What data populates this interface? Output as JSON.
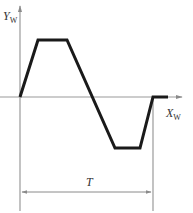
{
  "diagram": {
    "type": "trapezoidal-waveform",
    "y_axis_label": "Y",
    "y_axis_subscript": "W",
    "x_axis_label": "X",
    "x_axis_subscript": "W",
    "period_label": "T",
    "colors": {
      "axis": "#9a9a9a",
      "waveform": "#1a1a1a",
      "text": "#333333"
    },
    "waveform_points": [
      [
        20,
        97
      ],
      [
        38,
        40
      ],
      [
        67,
        40
      ],
      [
        115,
        148
      ],
      [
        140,
        148
      ],
      [
        153,
        97
      ],
      [
        168,
        97
      ]
    ]
  }
}
